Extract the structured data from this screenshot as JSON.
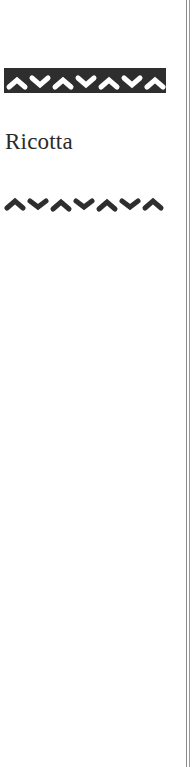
{
  "page": {
    "title": "Ricotta",
    "decorations": {
      "top_band": "zigzag-band-ornament",
      "bottom_wave": "zigzag-wave-ornament"
    },
    "colors": {
      "ink": "#2e2e2e",
      "title": "#2a2a2a",
      "rule": "#8a8a8a",
      "paper": "#ffffff"
    }
  }
}
